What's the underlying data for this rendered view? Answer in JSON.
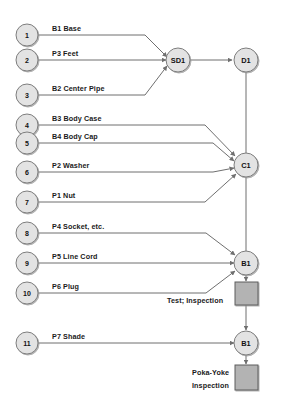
{
  "diagram": {
    "colors": {
      "node_fill": "#e3e3e3",
      "node_stroke": "#7d7d7d",
      "box_fill": "#b3b3b3",
      "box_stroke": "#5c5c5c",
      "line": "#6f6f6f",
      "background": "#ffffff",
      "text": "#111111"
    },
    "parts": [
      {
        "number": "1",
        "label": "B1 Base"
      },
      {
        "number": "2",
        "label": "P3 Feet"
      },
      {
        "number": "3",
        "label": "B2 Center Pipe"
      },
      {
        "number": "4",
        "label": "B3 Body Case"
      },
      {
        "number": "5",
        "label": "B4 Body Cap"
      },
      {
        "number": "6",
        "label": "P2 Washer"
      },
      {
        "number": "7",
        "label": "P1 Nut"
      },
      {
        "number": "8",
        "label": "P4 Socket, etc."
      },
      {
        "number": "9",
        "label": "P5 Line Cord"
      },
      {
        "number": "10",
        "label": "P6 Plug"
      },
      {
        "number": "11",
        "label": "P7 Shade"
      }
    ],
    "operations": [
      {
        "id": "sd1",
        "label": "SD1"
      },
      {
        "id": "d1",
        "label": "D1"
      },
      {
        "id": "c1",
        "label": "C1"
      },
      {
        "id": "b1a",
        "label": "B1"
      },
      {
        "id": "b1b",
        "label": "B1"
      }
    ],
    "inspections": [
      {
        "id": "test-inspection",
        "label": "Test; Inspection"
      },
      {
        "id": "poka-yoke-inspection",
        "line1": "Poka-Yoke",
        "line2": "Inspection"
      }
    ]
  }
}
